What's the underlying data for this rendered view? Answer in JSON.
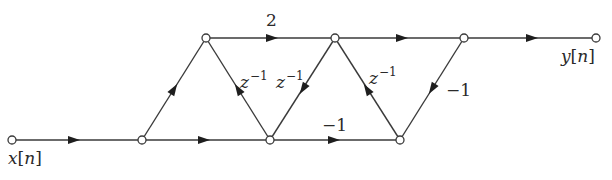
{
  "diagram": {
    "type": "signal-flow-graph",
    "nodes": [
      {
        "id": "x",
        "x": 12,
        "y": 140,
        "label": "x[n]"
      },
      {
        "id": "b1",
        "x": 142,
        "y": 140
      },
      {
        "id": "t1",
        "x": 206,
        "y": 38
      },
      {
        "id": "b2",
        "x": 270,
        "y": 140
      },
      {
        "id": "t2",
        "x": 335,
        "y": 38
      },
      {
        "id": "b3",
        "x": 400,
        "y": 140
      },
      {
        "id": "t3",
        "x": 464,
        "y": 38
      },
      {
        "id": "y",
        "x": 596,
        "y": 38,
        "label": "y[n]"
      }
    ],
    "edges": [
      {
        "from": "x",
        "to": "b1",
        "gain": ""
      },
      {
        "from": "b1",
        "to": "t1",
        "gain": ""
      },
      {
        "from": "b1",
        "to": "b2",
        "gain": ""
      },
      {
        "from": "t1",
        "to": "t2",
        "gain": "2"
      },
      {
        "from": "b2",
        "to": "t1",
        "gain": "z^-1"
      },
      {
        "from": "t2",
        "to": "b2",
        "gain": "z^-1"
      },
      {
        "from": "b2",
        "to": "b3",
        "gain": "-1"
      },
      {
        "from": "t2",
        "to": "t3",
        "gain": ""
      },
      {
        "from": "b3",
        "to": "t2",
        "gain": "z^-1"
      },
      {
        "from": "t3",
        "to": "b3",
        "gain": "-1"
      },
      {
        "from": "t3",
        "to": "y",
        "gain": ""
      }
    ]
  },
  "labels": {
    "input": {
      "var": "x",
      "idx": "n"
    },
    "output": {
      "var": "y",
      "idx": "n"
    },
    "gain_2": "2",
    "gain_neg1_bottom": "−1",
    "gain_neg1_right": "−1",
    "z_base": "z",
    "z_exp": "−1"
  }
}
